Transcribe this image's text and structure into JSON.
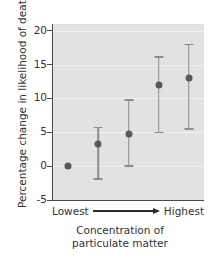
{
  "chart_data": {
    "type": "scatter",
    "title": "",
    "xlabel": "Concentration of particulate matter",
    "xlabel_lines": [
      "Concentration of",
      "particulate matter"
    ],
    "ylabel": "Percentage change in likelihood of death",
    "ylim": [
      -5,
      21
    ],
    "yticks": [
      20,
      15,
      10,
      5,
      0,
      -5
    ],
    "ytick_labels": [
      "20",
      "15",
      "10",
      "5",
      "0",
      "-5"
    ],
    "grid": true,
    "legend": "none",
    "x_axis_start_label": "Lowest",
    "x_axis_end_label": "Highest",
    "x_axis_arrow": "arrow-right",
    "categories": [
      "1",
      "2",
      "3",
      "4",
      "5"
    ],
    "values": [
      0,
      3.2,
      4.8,
      12.0,
      13.0
    ],
    "error_low": [
      0,
      -1.9,
      0.0,
      5.0,
      5.5
    ],
    "error_high": [
      0,
      5.7,
      9.8,
      16.1,
      18.0
    ],
    "points": [
      {
        "index": 1,
        "value": 0,
        "low": 0,
        "high": 0,
        "has_error_bar": false
      },
      {
        "index": 2,
        "value": 3.2,
        "low": -1.9,
        "high": 5.7,
        "has_error_bar": true
      },
      {
        "index": 3,
        "value": 4.8,
        "low": 0.0,
        "high": 9.8,
        "has_error_bar": true
      },
      {
        "index": 4,
        "value": 12.0,
        "low": 5.0,
        "high": 16.1,
        "has_error_bar": true
      },
      {
        "index": 5,
        "value": 13.0,
        "low": 5.5,
        "high": 18.0,
        "has_error_bar": true
      }
    ],
    "colors": {
      "plot_background": "#e2e2e2",
      "gridline": "#f1f1f1",
      "point": "#595959",
      "errorbar": "#8c8c8c",
      "axis": "#4a4a4a",
      "text": "#333333"
    }
  }
}
